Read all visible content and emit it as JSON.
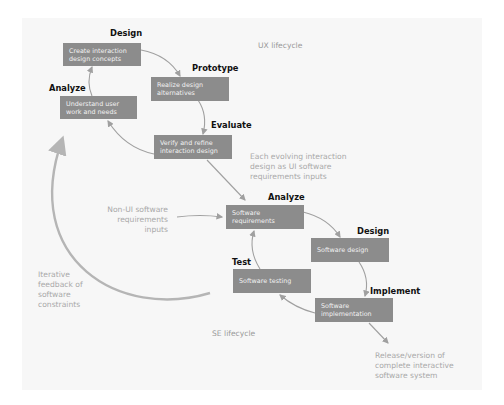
{
  "colors": {
    "box_fill": "#8c8c8c",
    "box_text": "#f2f2f2",
    "stage_label": "#111111",
    "annotation_text": "#a9a9a9",
    "arrow": "#a0a0a0",
    "background": "#f7f7f7"
  },
  "ux_lifecycle": {
    "title": "UX lifecycle",
    "stages": [
      {
        "label": "Analyze",
        "activity": "Understand user work and needs"
      },
      {
        "label": "Design",
        "activity": "Create interaction design concepts"
      },
      {
        "label": "Prototype",
        "activity": "Realize design alternatives"
      },
      {
        "label": "Evaluate",
        "activity": "Verify and refine interaction design"
      }
    ]
  },
  "se_lifecycle": {
    "title": "SE lifecycle",
    "stages": [
      {
        "label": "Analyze",
        "activity": "Software requirements"
      },
      {
        "label": "Design",
        "activity": "Software design"
      },
      {
        "label": "Implement",
        "activity": "Software implementation"
      },
      {
        "label": "Test",
        "activity": "Software testing"
      }
    ]
  },
  "annotations": {
    "ux_to_se": "Each evolving interaction\ndesign as UI software\nrequirements inputs",
    "non_ui": "Non-UI software\nrequirements\ninputs",
    "feedback": "Iterative\nfeedback of\nsoftware\nconstraints",
    "release": "Release/version of\ncomplete interactive\nsoftware system"
  }
}
